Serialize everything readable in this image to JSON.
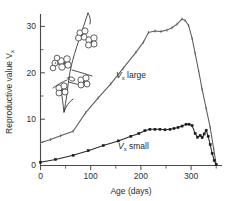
{
  "figure": {
    "name": "reproductive-value-vs-age-chart",
    "background_color": "#ffffff",
    "axis_color": "#4a4a4a"
  },
  "chart_data": {
    "type": "line",
    "title": "",
    "subtitle": "",
    "xlabel": "Age (days)",
    "ylabel": "Reproductive value V",
    "ylabel_subscript": "x",
    "xlim": [
      0,
      360
    ],
    "ylim": [
      0,
      33
    ],
    "xticks": [
      0,
      100,
      200,
      300
    ],
    "xticklabels": [
      "0",
      "100",
      "200",
      "300"
    ],
    "xticks_minor": [
      50,
      150,
      250,
      350
    ],
    "yticks": [
      0,
      10,
      20,
      30
    ],
    "yticklabels": [
      "0",
      "10",
      "20",
      "30"
    ],
    "yticks_minor": [
      5,
      15,
      25
    ],
    "grid": false,
    "legend_position": "inline-annotations",
    "annotations": [
      {
        "name": "vx-large-label",
        "text_italic": "V",
        "text_subscript": "x",
        "text_rest": " large",
        "full_text": "Vx large",
        "x": 150,
        "y": 22
      },
      {
        "name": "vx-small-label",
        "text_italic": "V",
        "text_subscript": "x",
        "text_rest": " small",
        "full_text": "Vx small",
        "x": 155,
        "y": 4.6
      }
    ],
    "series": [
      {
        "name": "Vx large",
        "color": "#5a5a5a",
        "marker": "open-tick",
        "x": [
          0,
          20,
          40,
          65,
          90,
          115,
          140,
          165,
          190,
          205,
          215,
          228,
          240,
          252,
          262,
          272,
          282,
          288,
          295,
          302,
          308,
          315,
          322,
          330,
          338,
          345,
          350
        ],
        "values": [
          4.9,
          5.6,
          6.4,
          7.4,
          11.4,
          14.6,
          17.6,
          21.0,
          24.4,
          26.6,
          28.7,
          29.0,
          28.9,
          29.2,
          29.7,
          30.5,
          31.6,
          31.3,
          30.2,
          27.4,
          24.2,
          20.4,
          16.4,
          12.3,
          8.2,
          3.6,
          0.2
        ]
      },
      {
        "name": "Vx small",
        "color": "#1a1a1a",
        "marker": "filled-square",
        "x": [
          0,
          30,
          65,
          95,
          125,
          155,
          180,
          196,
          208,
          218,
          228,
          238,
          248,
          258,
          266,
          274,
          282,
          290,
          296,
          302,
          308,
          313,
          318,
          322,
          326,
          330,
          334,
          338,
          342,
          346,
          350
        ],
        "values": [
          0.7,
          1.3,
          2.2,
          3.2,
          4.3,
          5.3,
          6.3,
          6.9,
          7.5,
          7.8,
          7.8,
          7.8,
          7.7,
          7.8,
          8.0,
          8.2,
          8.5,
          8.9,
          8.9,
          8.6,
          6.9,
          6.1,
          6.5,
          6.0,
          6.8,
          7.6,
          6.3,
          4.5,
          2.6,
          1.1,
          0.2
        ]
      }
    ]
  },
  "inset": {
    "name": "plant-line-drawing",
    "description": "flowering-branch-illustration",
    "flower_count": 6
  }
}
